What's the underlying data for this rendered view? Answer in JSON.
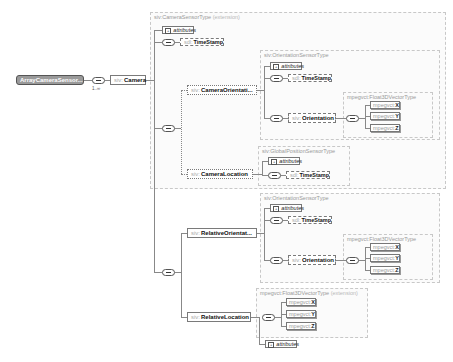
{
  "root": {
    "name": "ArrayCameraSensor...",
    "multiplicity": "1..∞"
  },
  "camera": {
    "ns": "siv:",
    "name": "Camera"
  },
  "camera_group": {
    "type": "siv:CameraSensorType",
    "ext": "(extension)"
  },
  "attributes_label": "attributes",
  "timestamp": {
    "ns": "sdl:",
    "name": "TimeStamp"
  },
  "camera_orientation": {
    "ns": "siv:",
    "name": "CameraOrientati..."
  },
  "camera_location": {
    "ns": "siv:",
    "name": "CameraLocation"
  },
  "orientation_group_1": {
    "type": "siv:OrientationSensorType"
  },
  "orientation_group_2": {
    "type": "siv:OrientationSensorType"
  },
  "gps_group": {
    "type": "siv:GlobalPositionSensorType"
  },
  "orientation": {
    "ns": "siv:",
    "name": "Orientation"
  },
  "vector_group": {
    "type": "mpegvct:Float3DVectorType"
  },
  "vector_group_ext": {
    "type": "mpegvct:Float3DVectorType",
    "ext": "(extension)"
  },
  "vec": {
    "ns": "mpegvct:",
    "x": "X",
    "y": "Y",
    "z": "Z"
  },
  "relative_orientation": {
    "ns": "siv:",
    "name": "RelativeOrientat..."
  },
  "relative_location": {
    "ns": "siv:",
    "name": "RelativeLocation"
  }
}
